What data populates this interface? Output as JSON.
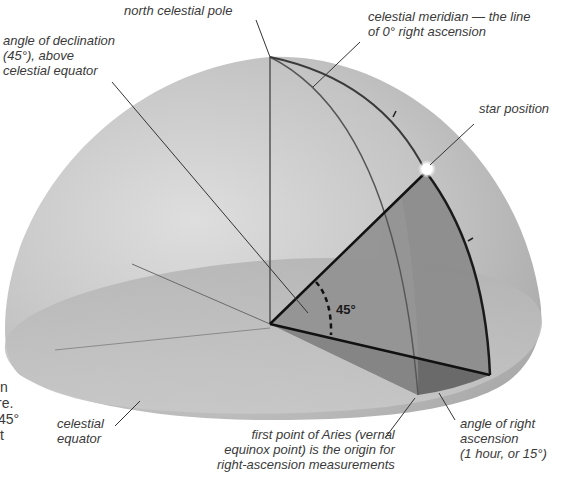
{
  "diagram": {
    "labels": {
      "north_celestial_pole": "north celestial pole",
      "declination": "angle of declination\n(45°), above\ncelestial equator",
      "celestial_meridian": "celestial meridian — the line\nof 0° right ascension",
      "star_position": "star position",
      "celestial_equator": "celestial\nequator",
      "first_point_aries": "first point of Aries (vernal\nequinox point) is the origin for\nright-ascension measurements",
      "right_ascension": "angle of right\nascension\n(1 hour, or 15°)",
      "angle_value": "45°"
    },
    "cut_off_text": {
      "lines": [
        "n",
        "re.",
        "45°",
        "t"
      ]
    },
    "colors": {
      "dome": "#b9b9b9",
      "dome_light": "#d8d8d8",
      "equator_plane": "#a8a8a8",
      "declination_wedge": "#8a8a8a",
      "ra_wedge": "#6e6e6e",
      "lines": "#2b2b2b",
      "star": "#ffffff"
    }
  }
}
